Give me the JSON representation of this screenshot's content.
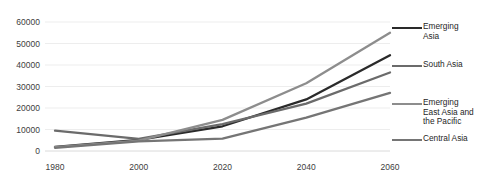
{
  "chart_data": {
    "type": "line",
    "title": "",
    "xlabel": "",
    "ylabel": "",
    "x": [
      1980,
      2000,
      2020,
      2040,
      2060
    ],
    "xtick_labels": [
      "1980",
      "2000",
      "2020",
      "2040",
      "2060"
    ],
    "ytick_labels": [
      "0",
      "10000",
      "20000",
      "30000",
      "40000",
      "50000",
      "60000"
    ],
    "yticks": [
      0,
      10000,
      20000,
      30000,
      40000,
      50000,
      60000
    ],
    "ylim": [
      0,
      60000
    ],
    "xlim": [
      1980,
      2060
    ],
    "grid": "horizontal",
    "legend_position": "right",
    "series": [
      {
        "name": "Emerging Asia",
        "label": "Emerging\nAsia",
        "color": "#2a2a2a",
        "values": [
          1900,
          5200,
          11500,
          24000,
          44500
        ]
      },
      {
        "name": "South Asia",
        "label": "South Asia",
        "color": "#6b6b6b",
        "values": [
          9500,
          5600,
          12500,
          22000,
          36500
        ]
      },
      {
        "name": "Emerging East Asia and the Pacific",
        "label": "Emerging\nEast Asia and\nthe Pacific",
        "color": "#8d8d8d",
        "values": [
          1800,
          4800,
          14500,
          31500,
          55000
        ]
      },
      {
        "name": "Central Asia",
        "label": "Central Asia",
        "color": "#757575",
        "values": [
          1500,
          4500,
          5800,
          15500,
          27000
        ]
      }
    ]
  },
  "axis": {
    "gridline_color": "#e8e8e8",
    "axis_color": "#d0d0d0",
    "tick_text_color": "#404040"
  }
}
